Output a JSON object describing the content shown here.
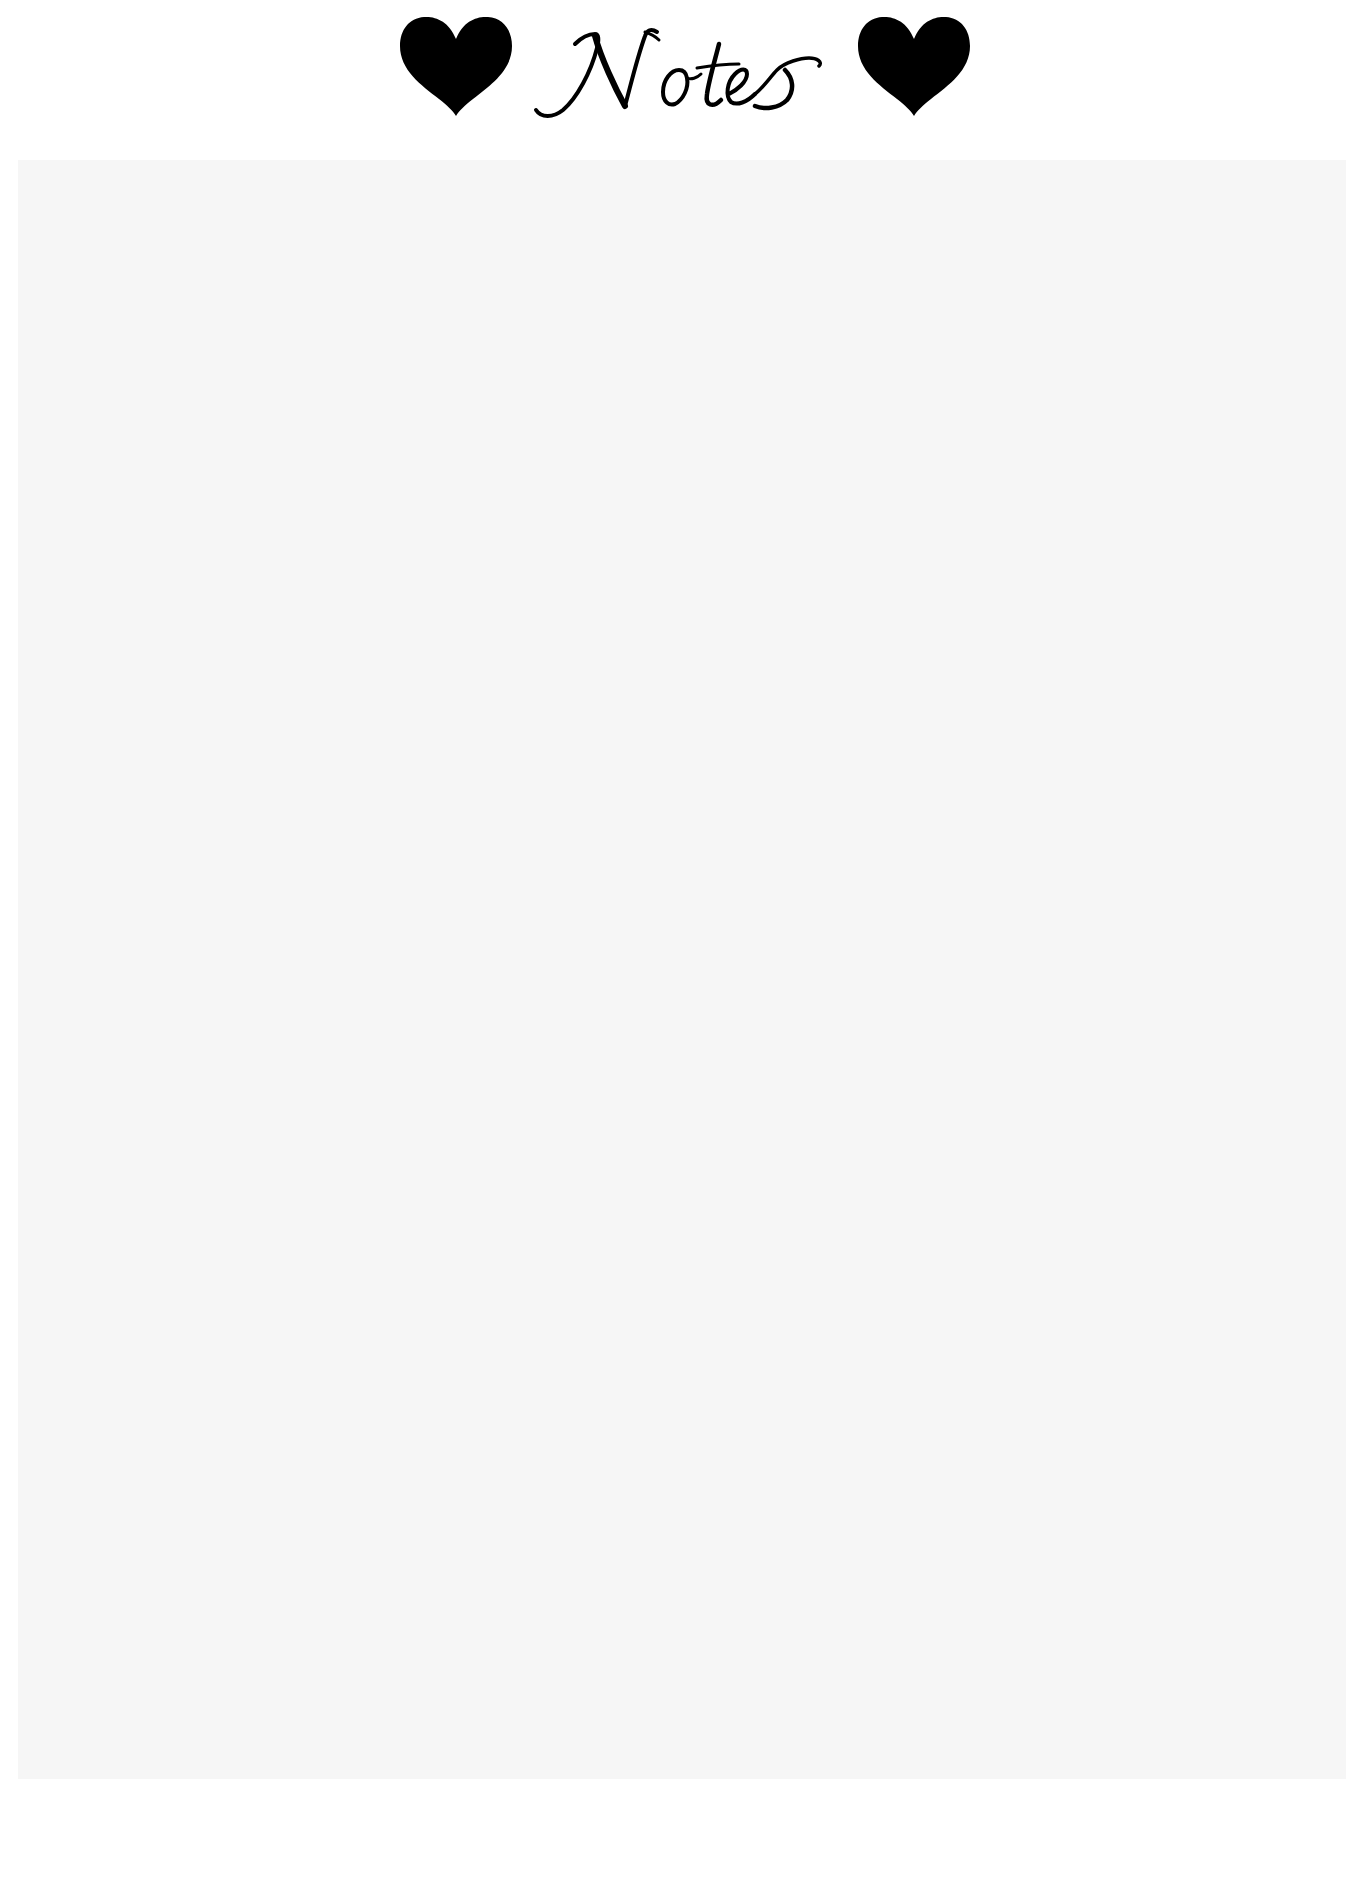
{
  "page": {
    "title": "Notes",
    "background_color": "#ffffff",
    "ink_color": "#000000"
  },
  "header": {
    "title_text": "Notes",
    "left_icon": "heart-icon",
    "right_icon": "heart-icon"
  },
  "notes_area": {
    "value": "",
    "placeholder": "",
    "fill_color": "#f6f6f6"
  }
}
